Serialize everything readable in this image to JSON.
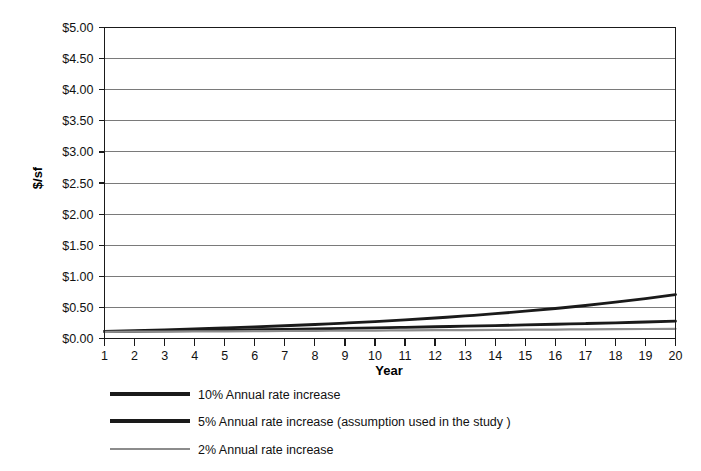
{
  "chart_data": {
    "type": "line",
    "title": "",
    "xlabel": "Year",
    "ylabel": "$/sf",
    "x": [
      1,
      2,
      3,
      4,
      5,
      6,
      7,
      8,
      9,
      10,
      11,
      12,
      13,
      14,
      15,
      16,
      17,
      18,
      19,
      20
    ],
    "xlim": [
      1,
      20
    ],
    "ylim": [
      0,
      5
    ],
    "y_tick_labels": [
      "$0.00",
      "$0.50",
      "$1.00",
      "$1.50",
      "$2.00",
      "$2.50",
      "$3.00",
      "$3.50",
      "$4.00",
      "$4.50",
      "$5.00"
    ],
    "y_tick_values": [
      0,
      0.5,
      1.0,
      1.5,
      2.0,
      2.5,
      3.0,
      3.5,
      4.0,
      4.5,
      5.0
    ],
    "x_tick_labels": [
      "1",
      "2",
      "3",
      "4",
      "5",
      "6",
      "7",
      "8",
      "9",
      "10",
      "11",
      "12",
      "13",
      "14",
      "15",
      "16",
      "17",
      "18",
      "19",
      "20"
    ],
    "grid": "horizontal",
    "legend_position": "below-left",
    "series": [
      {
        "name": "10% Annual rate increase",
        "color": "#1a1a1a",
        "width": 2.8,
        "values": [
          0.105,
          0.116,
          0.127,
          0.14,
          0.154,
          0.169,
          0.186,
          0.205,
          0.225,
          0.248,
          0.273,
          0.3,
          0.33,
          0.363,
          0.399,
          0.439,
          0.483,
          0.531,
          0.584,
          0.643
        ]
      },
      {
        "name": "5% Annual rate increase (assumption used in the study )",
        "color": "#1a1a1a",
        "width": 2.8,
        "values": [
          0.105,
          0.11,
          0.116,
          0.122,
          0.128,
          0.134,
          0.141,
          0.148,
          0.155,
          0.163,
          0.171,
          0.18,
          0.189,
          0.198,
          0.208,
          0.218,
          0.229,
          0.241,
          0.253,
          0.266
        ]
      },
      {
        "name": "2% Annual rate increase",
        "color": "#8c8c8c",
        "width": 2.2,
        "values": [
          0.105,
          0.107,
          0.109,
          0.111,
          0.114,
          0.116,
          0.118,
          0.121,
          0.123,
          0.126,
          0.128,
          0.131,
          0.133,
          0.136,
          0.139,
          0.141,
          0.144,
          0.147,
          0.15,
          0.153
        ]
      }
    ],
    "series_endpoints": {
      "10% Annual rate increase": 4.87,
      "5% Annual rate increase (assumption used in the study )": 2.84,
      "2% Annual rate increase": 2.09
    },
    "series_plot_values": [
      {
        "name": "10% Annual rate increase",
        "values": [
          0.11,
          0.12,
          0.13,
          0.15,
          0.16,
          0.18,
          0.19,
          0.21,
          0.23,
          0.26,
          0.28,
          0.31,
          0.34,
          0.38,
          0.41,
          0.45,
          0.5,
          0.55,
          0.6,
          4.87
        ]
      }
    ],
    "base_value": 0.105,
    "rates": [
      0.1,
      0.05,
      0.02
    ]
  },
  "legend": {
    "items": [
      {
        "label": "10% Annual rate increase",
        "color": "#1a1a1a",
        "thickness": "thick"
      },
      {
        "label": "5% Annual rate increase (assumption used in the study )",
        "color": "#1a1a1a",
        "thickness": "thick"
      },
      {
        "label": "2% Annual rate increase",
        "color": "#8c8c8c",
        "thickness": "thin"
      }
    ]
  },
  "axes": {
    "y_title": "$/sf",
    "x_title": "Year"
  }
}
